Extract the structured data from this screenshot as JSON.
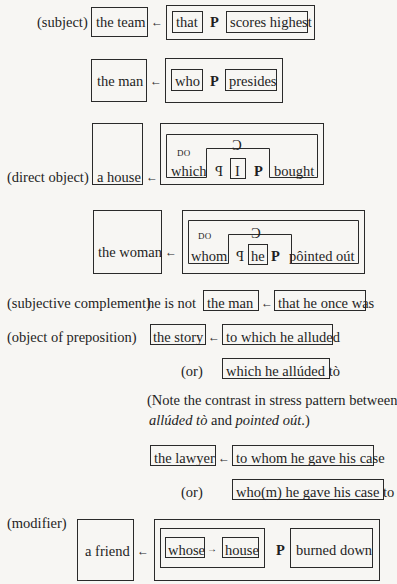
{
  "rows": {
    "subject": {
      "label": "(subject)",
      "antecedent": "the team",
      "arrow": "←",
      "rel": "that",
      "p": "P",
      "pred": "scores highest"
    },
    "subject2": {
      "antecedent": "the man",
      "arrow": "←",
      "rel": "who",
      "p": "P",
      "pred": "presides"
    },
    "direct_object": {
      "label": "(direct object)",
      "antecedent": "a house",
      "arrow": "←",
      "do": "DO",
      "c": "C",
      "rel": "which",
      "s": "P",
      "subj": "I",
      "p": "P",
      "pred": "bought"
    },
    "direct_object2": {
      "antecedent": "the woman",
      "arrow": "←",
      "do": "DO",
      "c": "C",
      "rel": "whom",
      "s": "P",
      "subj": "he",
      "p": "P",
      "pred": "pôinted oút"
    },
    "subjective_complement": {
      "label": "(subjective complement)",
      "prefix": "he is not",
      "antecedent": "the man",
      "arrow": "←",
      "clause": "that he once was"
    },
    "object_of_preposition": {
      "label": "(object of preposition)",
      "antecedent": "the story",
      "arrow": "←",
      "clause": "to which he alluded",
      "or": "(or)",
      "alt_clause": "which he allúded tò"
    },
    "note": {
      "line1": "(Note the contrast in stress pattern between",
      "em1": "allúded tò",
      "and": " and ",
      "em2": "pointed oút",
      "end": ".)"
    },
    "lawyer": {
      "antecedent": "the lawyer",
      "arrow": "←",
      "clause": "to whom he gave his case",
      "or": "(or)",
      "alt_clause": "who(m) he gave his case to"
    },
    "modifier": {
      "label": "(modifier)",
      "antecedent": "a friend",
      "arrow": "←",
      "rel": "whose",
      "inner_arrow": "→",
      "head": "house",
      "p": "P",
      "pred": "burned down"
    }
  }
}
